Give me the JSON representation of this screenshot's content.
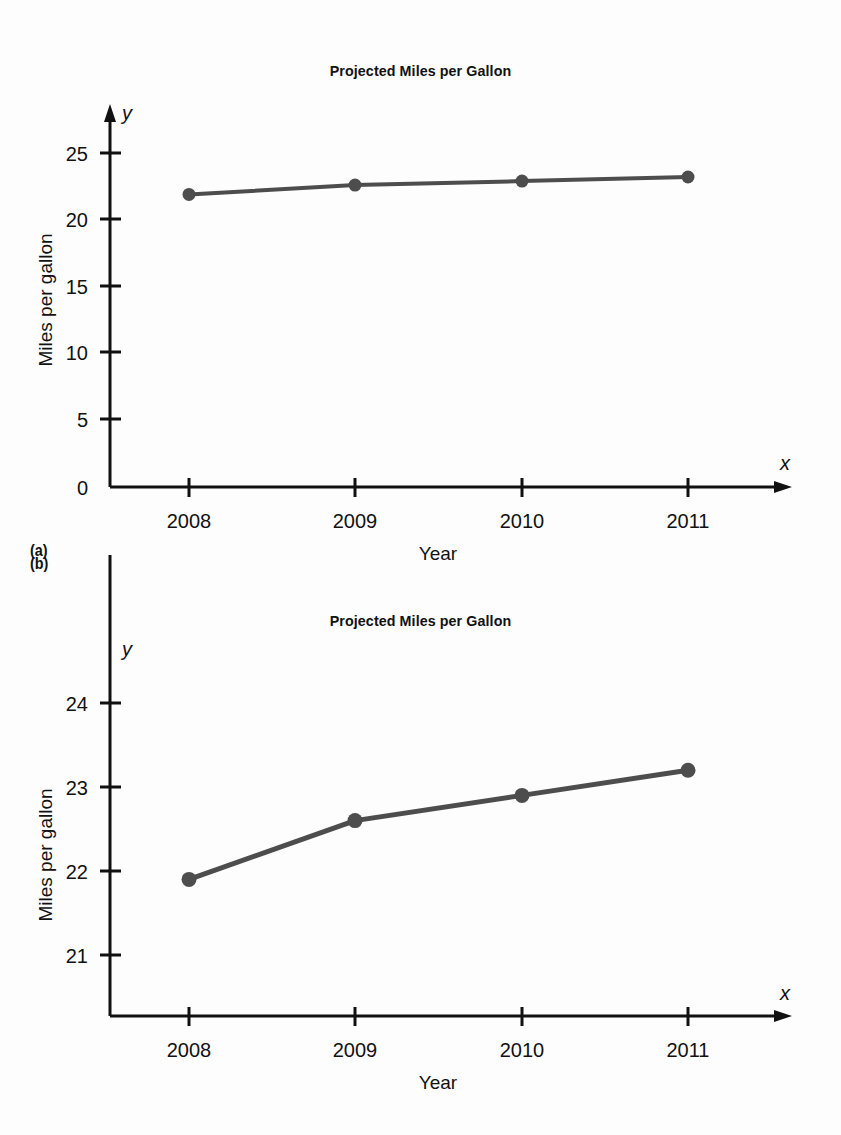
{
  "page": {
    "background": "#fdfdfd",
    "width": 841,
    "height": 1135
  },
  "figures": [
    {
      "panel_label": "(a)",
      "title": "Projected Miles per Gallon",
      "x_axis_variable": "x",
      "y_axis_variable": "y",
      "x_axis_label": "Year",
      "y_axis_label": "Miles per gallon"
    },
    {
      "panel_label": "(b)",
      "title": "Projected Miles per Gallon",
      "x_axis_variable": "x",
      "y_axis_variable": "y",
      "x_axis_label": "Year",
      "y_axis_label": "Miles per gallon"
    }
  ],
  "chart_data": [
    {
      "type": "line",
      "title": "Projected Miles per Gallon",
      "panel": "(a)",
      "xlabel": "Year",
      "ylabel": "Miles per gallon",
      "x_variable": "x",
      "y_variable": "y",
      "categories": [
        "2008",
        "2009",
        "2010",
        "2011"
      ],
      "values": [
        21.9,
        22.6,
        22.9,
        23.2
      ],
      "ylim": [
        0,
        27
      ],
      "yticks": [
        0,
        5,
        10,
        15,
        20,
        25
      ],
      "ytick_labels": [
        "0",
        "5",
        "10",
        "15",
        "20",
        "25"
      ],
      "xtick_labels": [
        "2008",
        "2009",
        "2010",
        "2011"
      ],
      "grid": false,
      "legend": "none",
      "marker": "filled-circle",
      "line_color": "#4d4d4d",
      "axis_color": "#111111",
      "note": "Full y-axis from 0 makes the increase look nearly flat"
    },
    {
      "type": "line",
      "title": "Projected Miles per Gallon",
      "panel": "(b)",
      "xlabel": "Year",
      "ylabel": "Miles per gallon",
      "x_variable": "x",
      "y_variable": "y",
      "categories": [
        "2008",
        "2009",
        "2010",
        "2011"
      ],
      "values": [
        21.9,
        22.6,
        22.9,
        23.2
      ],
      "ylim": [
        20.6,
        24.5
      ],
      "yticks": [
        21,
        22,
        23,
        24
      ],
      "ytick_labels": [
        "21",
        "22",
        "23",
        "24"
      ],
      "xtick_labels": [
        "2008",
        "2009",
        "2010",
        "2011"
      ],
      "grid": false,
      "legend": "none",
      "marker": "filled-circle",
      "line_color": "#4d4d4d",
      "axis_color": "#111111",
      "note": "Truncated y-axis starting near 21 exaggerates the same increase"
    }
  ]
}
